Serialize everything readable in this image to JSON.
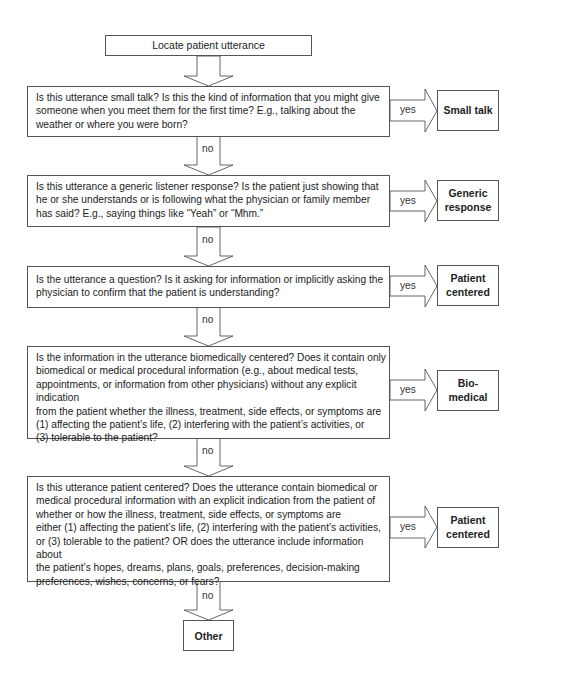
{
  "diagram": {
    "type": "decision-flowchart",
    "start": {
      "label": "Locate patient utterance"
    },
    "steps": [
      {
        "question": "Is this utterance small talk? Is this the kind of information that you might give someone when you meet them for the first time? E.g., talking about the weather or where you were born?",
        "lines": [
          "Is this utterance small talk? Is this the kind of information that you might give",
          "someone when you meet them for the first time? E.g., talking about the",
          "weather or where you were born?"
        ],
        "yes_label": "yes",
        "no_label": "no",
        "outcome": {
          "label": "Small talk",
          "lines": [
            "Small talk"
          ]
        }
      },
      {
        "question": "Is this utterance a generic listener response? Is the patient just showing that he or she understands or is following what the physician or family member has said? E.g., saying things like “Yeah” or “Mhm.”",
        "lines": [
          "Is this utterance a generic listener response? Is the patient just showing that",
          "he or she understands or is following what the physician or family member",
          "has said? E.g., saying things like “Yeah” or “Mhm.”"
        ],
        "yes_label": "yes",
        "no_label": "no",
        "outcome": {
          "label": "Generic response",
          "lines": [
            "Generic",
            "response"
          ]
        }
      },
      {
        "question": "Is the utterance a question? Is it asking for information or implicitly asking the physician to confirm that the patient is understanding?",
        "lines": [
          "Is the utterance a question? Is it asking for information or implicitly asking the",
          "physician to confirm that the patient is understanding?"
        ],
        "yes_label": "yes",
        "no_label": "no",
        "outcome": {
          "label": "Patient centered",
          "lines": [
            "Patient",
            "centered"
          ]
        }
      },
      {
        "question": "Is the information in the utterance biomedically centered? Does it contain only biomedical or medical procedural information (e.g., about medical tests, appointments, or information from other physicians) without any explicit indication from the patient whether the illness, treatment, side effects, or symptoms are (1) affecting the patient’s life, (2) interfering with the patient’s activities, or (3) tolerable to the patient?",
        "lines": [
          "Is the information in the utterance biomedically centered? Does it contain only",
          "biomedical or medical procedural information (e.g., about medical tests,",
          "appointments, or information from other physicians) without any explicit indication",
          "from the patient whether the illness, treatment, side effects, or symptoms are",
          "(1) affecting the patient’s life, (2) interfering with the patient’s activities, or",
          "(3) tolerable to the patient?"
        ],
        "yes_label": "yes",
        "no_label": "no",
        "outcome": {
          "label": "Bio-medical",
          "lines": [
            "Bio-",
            "medical"
          ]
        }
      },
      {
        "question": "Is this utterance patient centered? Does the utterance contain biomedical or medical procedural information with an explicit indication from the patient of whether or how the illness, treatment, side effects, or symptoms are either (1) affecting the patient’s life, (2) interfering with the patient’s activities, or (3) tolerable to the patient? OR does the utterance include information about the patient’s hopes, dreams, plans, goals, preferences, decision-making preferences, wishes, concerns, or fears?",
        "lines": [
          "Is this utterance patient centered? Does the utterance contain biomedical or",
          "medical procedural information with an explicit indication from the patient of",
          "whether or how the illness, treatment, side effects, or symptoms are",
          "either (1) affecting the patient’s life, (2) interfering with the patient’s activities,",
          "or (3) tolerable to the patient? OR does the utterance include information about",
          "the patient’s hopes, dreams, plans, goals, preferences, decision-making",
          "preferences, wishes, concerns, or fears?"
        ],
        "yes_label": "yes",
        "no_label": "no",
        "outcome": {
          "label": "Patient centered",
          "lines": [
            "Patient",
            "centered"
          ]
        }
      }
    ],
    "final": {
      "label": "Other"
    },
    "colors": {
      "stroke": "#555555",
      "text": "#222222",
      "background": "#ffffff"
    }
  }
}
